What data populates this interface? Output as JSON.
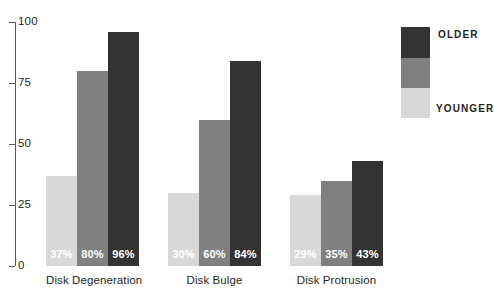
{
  "chart_data": {
    "type": "bar",
    "title": "",
    "xlabel": "",
    "ylabel": "",
    "ylim": [
      0,
      100
    ],
    "yticks": [
      "0",
      "25",
      "50",
      "75",
      "100"
    ],
    "grid": false,
    "legend_position": "right",
    "categories": [
      "Disk Degeneration",
      "Disk Bulge",
      "Disk Protrusion"
    ],
    "series": [
      {
        "name": "YOUNGER",
        "color": "#d8d8d8",
        "values": [
          37,
          30,
          29
        ],
        "labels": [
          "37%",
          "30%",
          "29%"
        ]
      },
      {
        "name": "",
        "color": "#808080",
        "values": [
          80,
          60,
          35
        ],
        "labels": [
          "80%",
          "60%",
          "35%"
        ]
      },
      {
        "name": "OLDER",
        "color": "#333333",
        "values": [
          96,
          84,
          43
        ],
        "labels": [
          "96%",
          "35%",
          "43%"
        ]
      }
    ],
    "bars": [
      {
        "group": "Disk Degeneration",
        "series": "younger",
        "value": 37,
        "label": "37%",
        "color": "#d8d8d8"
      },
      {
        "group": "Disk Degeneration",
        "series": "middle",
        "value": 80,
        "label": "80%",
        "color": "#808080"
      },
      {
        "group": "Disk Degeneration",
        "series": "older",
        "value": 96,
        "label": "96%",
        "color": "#333333"
      },
      {
        "group": "Disk Bulge",
        "series": "younger",
        "value": 30,
        "label": "30%",
        "color": "#d8d8d8"
      },
      {
        "group": "Disk Bulge",
        "series": "middle",
        "value": 60,
        "label": "60%",
        "color": "#808080"
      },
      {
        "group": "Disk Bulge",
        "series": "older",
        "value": 84,
        "label": "84%",
        "color": "#333333"
      },
      {
        "group": "Disk Protrusion",
        "series": "younger",
        "value": 29,
        "label": "29%",
        "color": "#d8d8d8"
      },
      {
        "group": "Disk Protrusion",
        "series": "middle",
        "value": 35,
        "label": "35%",
        "color": "#808080"
      },
      {
        "group": "Disk Protrusion",
        "series": "older",
        "value": 43,
        "label": "43%",
        "color": "#333333"
      }
    ]
  },
  "axis": {
    "ticks": [
      {
        "label": "100",
        "value": 100
      },
      {
        "label": "75",
        "value": 75
      },
      {
        "label": "50",
        "value": 50
      },
      {
        "label": "25",
        "value": 25
      },
      {
        "label": "0",
        "value": 0
      }
    ]
  },
  "groups": [
    {
      "label": "Disk Degeneration",
      "left": 46,
      "width": 93
    },
    {
      "label": "Disk Bulge",
      "left": 168,
      "width": 96
    },
    {
      "label": "Disk Protrusion",
      "left": 290,
      "width": 97
    }
  ],
  "legend": {
    "top_label": "OLDER",
    "bottom_label": "YOUNGER",
    "swatches": [
      {
        "name": "older",
        "color": "#333333"
      },
      {
        "name": "middle",
        "color": "#808080"
      },
      {
        "name": "younger",
        "color": "#d8d8d8"
      }
    ]
  },
  "colors": {
    "older": "#333333",
    "middle": "#808080",
    "younger": "#d8d8d8",
    "axis": "#5a5a5a",
    "text": "#231f20",
    "value_text": "#ffffff",
    "background": "#ffffff"
  }
}
